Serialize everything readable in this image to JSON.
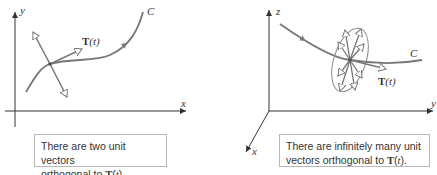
{
  "left_panel": {
    "axis_x_label": "x",
    "axis_y_label": "y",
    "curve_label": "C",
    "vector_label_bold": "T",
    "vector_label_arg": "(t)",
    "caption_line1": "There are two unit vectors",
    "caption_line2_prefix": "orthogonal to ",
    "caption_bold": "T",
    "caption_paren_open": "(",
    "caption_arg": "t",
    "caption_paren_close": ")."
  },
  "right_panel": {
    "axis_x_label": "x",
    "axis_y_label": "y",
    "axis_z_label": "z",
    "curve_label": "C",
    "vector_label_bold": "T",
    "vector_label_arg": "(t)",
    "caption_line1": "There are infinitely many unit",
    "caption_line2_prefix": "vectors orthogonal to ",
    "caption_bold": "T",
    "caption_paren_open": "(",
    "caption_arg": "t",
    "caption_paren_close": ")."
  },
  "colors": {
    "curve": "#777777",
    "axis": "#333333",
    "caption_border": "#b8b8b8"
  }
}
